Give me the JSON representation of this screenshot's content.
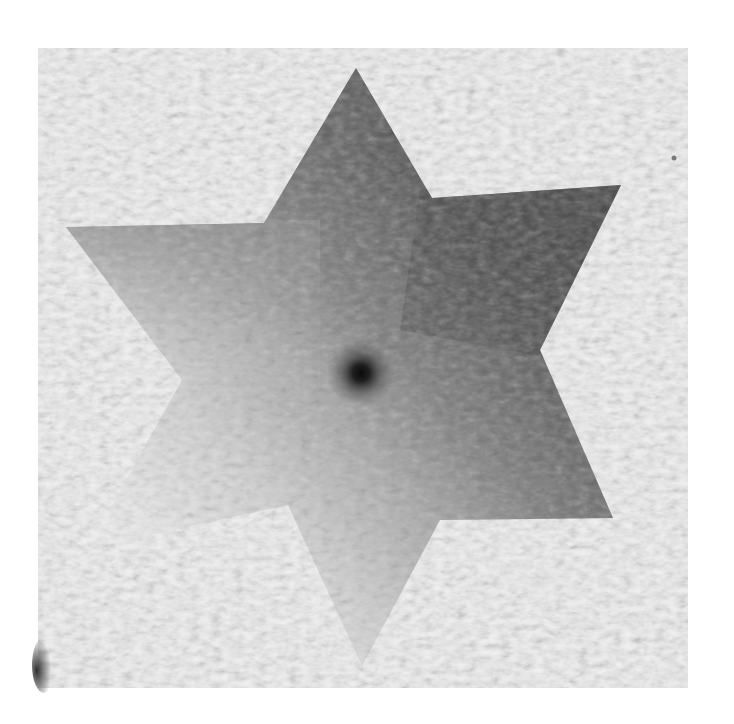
{
  "image": {
    "kind": "photograph",
    "subject": "six-pointed watercolor star on textured cold-press paper",
    "alt": "Grayscale watercolor six-pointed star painted on textured white paper, darker on the right and upper-right, fading to very pale at the lower left, with a dark spot near the center."
  },
  "canvas": {
    "width": 734,
    "height": 724,
    "background": "#ffffff"
  },
  "paper": {
    "bounds": {
      "x": 38,
      "y": 48,
      "width": 650,
      "height": 640
    },
    "color": "#f1f1f1",
    "texture_color": "#d9d9d9",
    "corner_smudge": {
      "x": 40,
      "y": 640,
      "color": "#3a3a3a"
    },
    "speck": {
      "x": 674,
      "y": 158,
      "color": "#7a7a7a"
    }
  },
  "star": {
    "points": "356,68 432,198 621,185 540,350 613,518 440,520 362,666 288,505 88,548 182,380 66,227 264,223",
    "colors": {
      "light": "#e2e2e2",
      "mid": "#a8a8a8",
      "dark": "#5e5e5e",
      "darkest": "#4a4a4a"
    },
    "center_spot": {
      "x": 361,
      "y": 373,
      "color": "#101010"
    }
  }
}
